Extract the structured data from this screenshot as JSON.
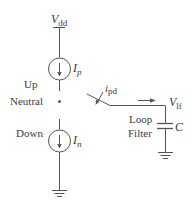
{
  "diagram": {
    "type": "charge-pump-circuit",
    "colors": {
      "stroke": "#555555",
      "text": "#3a3a3a",
      "background": "#ffffff"
    },
    "supply": {
      "symbol": "V",
      "subscript": "dd"
    },
    "up_source": {
      "state_label": "Up",
      "current_symbol": "I",
      "current_subscript": "p"
    },
    "neutral": {
      "label": "Neutral"
    },
    "down_source": {
      "state_label": "Down",
      "current_symbol": "I",
      "current_subscript": "n"
    },
    "switch_current": {
      "symbol": "i",
      "subscript": "pd"
    },
    "output": {
      "symbol": "V",
      "subscript": "lf"
    },
    "filter": {
      "line1": "Loop",
      "line2": "Filter",
      "capacitor_label": "C"
    }
  }
}
